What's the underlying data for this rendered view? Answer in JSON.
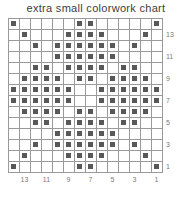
{
  "chart_title": "extra small colorwork chart",
  "chart_data": {
    "type": "heatmap",
    "title": "extra small colorwork chart",
    "xlabel": "",
    "ylabel": "",
    "grid": true,
    "legend_position": "none",
    "columns": 14,
    "rows": 14,
    "cell_colors": {
      "empty": "#ffffff",
      "filled": "#585858",
      "gridline": "#9a9a9a"
    },
    "row_labels_side": "right",
    "row_labels": [
      "13",
      "11",
      "9",
      "7",
      "5",
      "3",
      "1"
    ],
    "row_label_rows": [
      2,
      4,
      6,
      8,
      10,
      12,
      14
    ],
    "column_labels_side": "bottom",
    "column_labels": [
      "13",
      "11",
      "9",
      "7",
      "5",
      "3",
      "1"
    ],
    "column_label_columns": [
      2,
      4,
      6,
      8,
      10,
      12,
      14
    ],
    "cells": [
      [
        1,
        0,
        0,
        0,
        0,
        0,
        1,
        1,
        0,
        0,
        0,
        0,
        0,
        1
      ],
      [
        0,
        1,
        0,
        0,
        0,
        1,
        1,
        1,
        1,
        0,
        0,
        0,
        1,
        0
      ],
      [
        0,
        0,
        1,
        0,
        1,
        1,
        1,
        1,
        1,
        1,
        0,
        1,
        0,
        0
      ],
      [
        0,
        0,
        0,
        0,
        1,
        1,
        1,
        1,
        1,
        1,
        0,
        0,
        0,
        0
      ],
      [
        0,
        0,
        1,
        1,
        0,
        1,
        1,
        1,
        1,
        0,
        1,
        1,
        0,
        0
      ],
      [
        0,
        1,
        1,
        1,
        1,
        0,
        1,
        1,
        0,
        1,
        1,
        1,
        1,
        0
      ],
      [
        1,
        1,
        1,
        1,
        1,
        1,
        0,
        0,
        1,
        1,
        1,
        1,
        1,
        1
      ],
      [
        1,
        1,
        1,
        1,
        1,
        1,
        0,
        0,
        1,
        1,
        1,
        1,
        1,
        1
      ],
      [
        0,
        1,
        1,
        1,
        1,
        0,
        1,
        1,
        0,
        1,
        1,
        1,
        1,
        0
      ],
      [
        0,
        0,
        1,
        1,
        0,
        1,
        1,
        1,
        1,
        0,
        1,
        1,
        0,
        0
      ],
      [
        0,
        0,
        0,
        0,
        1,
        1,
        1,
        1,
        1,
        1,
        0,
        0,
        0,
        0
      ],
      [
        0,
        0,
        1,
        0,
        1,
        1,
        1,
        1,
        1,
        1,
        0,
        1,
        0,
        0
      ],
      [
        0,
        1,
        0,
        0,
        0,
        1,
        1,
        1,
        1,
        0,
        0,
        0,
        1,
        0
      ],
      [
        1,
        0,
        0,
        0,
        0,
        0,
        1,
        1,
        0,
        0,
        0,
        0,
        0,
        1
      ]
    ]
  }
}
